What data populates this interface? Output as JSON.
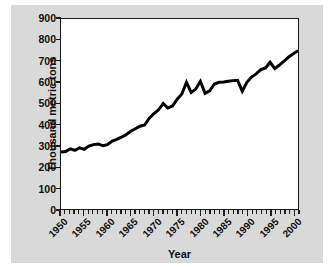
{
  "chart_data": {
    "type": "line",
    "title": "",
    "xlabel": "Year",
    "ylabel": "Thousand metric tons",
    "xlim": [
      1950,
      2001
    ],
    "ylim": [
      0,
      900
    ],
    "grid": false,
    "legend": null,
    "y_ticks": [
      0,
      100,
      200,
      300,
      400,
      500,
      600,
      700,
      800,
      900
    ],
    "y_tick_labels": [
      "0",
      "100",
      "200",
      "300",
      "400",
      "500",
      "600",
      "700",
      "800",
      "900"
    ],
    "x_ticks": [
      1950,
      1955,
      1960,
      1965,
      1970,
      1975,
      1980,
      1985,
      1990,
      1995,
      2000
    ],
    "x_tick_labels": [
      "1950",
      "1955",
      "1960",
      "1965",
      "1970",
      "1975",
      "1980",
      "1985",
      "1990",
      "1995",
      "2000"
    ],
    "x_minor_tick_interval": 1,
    "line_color": "#000000",
    "line_width": 3,
    "series": [
      {
        "name": "Production",
        "x": [
          1950,
          1951,
          1952,
          1953,
          1954,
          1955,
          1956,
          1957,
          1958,
          1959,
          1960,
          1961,
          1962,
          1963,
          1964,
          1965,
          1966,
          1967,
          1968,
          1969,
          1970,
          1971,
          1972,
          1973,
          1974,
          1975,
          1976,
          1977,
          1978,
          1979,
          1980,
          1981,
          1982,
          1983,
          1984,
          1985,
          1986,
          1987,
          1988,
          1989,
          1990,
          1991,
          1992,
          1993,
          1994,
          1995,
          1996,
          1997,
          1998,
          1999,
          2000,
          2001
        ],
        "values": [
          270,
          272,
          285,
          278,
          290,
          283,
          298,
          305,
          308,
          300,
          305,
          322,
          330,
          340,
          352,
          368,
          380,
          392,
          398,
          430,
          452,
          470,
          500,
          478,
          488,
          520,
          545,
          600,
          552,
          568,
          605,
          548,
          560,
          592,
          600,
          602,
          605,
          608,
          610,
          558,
          600,
          625,
          640,
          660,
          668,
          695,
          665,
          682,
          700,
          720,
          735,
          750
        ]
      }
    ]
  },
  "axes": {
    "y_axis_title": "Thousand metric tons",
    "x_axis_title": "Year"
  }
}
